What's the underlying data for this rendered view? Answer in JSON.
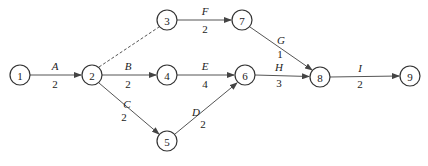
{
  "diagram": {
    "type": "activity-on-arrow network",
    "nodes": [
      {
        "id": "1",
        "label": "1",
        "x": 20,
        "y": 75
      },
      {
        "id": "2",
        "label": "2",
        "x": 92,
        "y": 75
      },
      {
        "id": "3",
        "label": "3",
        "x": 167,
        "y": 20
      },
      {
        "id": "4",
        "label": "4",
        "x": 167,
        "y": 75
      },
      {
        "id": "5",
        "label": "5",
        "x": 167,
        "y": 141
      },
      {
        "id": "6",
        "label": "6",
        "x": 245,
        "y": 75
      },
      {
        "id": "7",
        "label": "7",
        "x": 242,
        "y": 20
      },
      {
        "id": "8",
        "label": "8",
        "x": 320,
        "y": 77
      },
      {
        "id": "9",
        "label": "9",
        "x": 410,
        "y": 76
      }
    ],
    "edges": [
      {
        "from": "1",
        "to": "2",
        "activity": "A",
        "duration": "2",
        "dummy": false
      },
      {
        "from": "2",
        "to": "3",
        "activity": "",
        "duration": "",
        "dummy": true
      },
      {
        "from": "2",
        "to": "4",
        "activity": "B",
        "duration": "2",
        "dummy": false
      },
      {
        "from": "2",
        "to": "5",
        "activity": "C",
        "duration": "2",
        "dummy": false
      },
      {
        "from": "3",
        "to": "7",
        "activity": "F",
        "duration": "2",
        "dummy": false
      },
      {
        "from": "4",
        "to": "6",
        "activity": "E",
        "duration": "4",
        "dummy": false
      },
      {
        "from": "5",
        "to": "6",
        "activity": "D",
        "duration": "2",
        "dummy": false
      },
      {
        "from": "7",
        "to": "8",
        "activity": "G",
        "duration": "1",
        "dummy": false
      },
      {
        "from": "6",
        "to": "8",
        "activity": "H",
        "duration": "3",
        "dummy": false
      },
      {
        "from": "8",
        "to": "9",
        "activity": "I",
        "duration": "2",
        "dummy": false
      }
    ],
    "labels": {
      "node_1": "1",
      "node_2": "2",
      "node_3": "3",
      "node_4": "4",
      "node_5": "5",
      "node_6": "6",
      "node_7": "7",
      "node_8": "8",
      "node_9": "9",
      "A": "A",
      "A_dur": "2",
      "B": "B",
      "B_dur": "2",
      "C": "C",
      "C_dur": "2",
      "D": "D",
      "D_dur": "2",
      "E": "E",
      "E_dur": "4",
      "F": "F",
      "F_dur": "2",
      "G": "G",
      "G_dur": "1",
      "H": "H",
      "H_dur": "3",
      "I": "I",
      "I_dur": "2"
    },
    "colors": {
      "stroke": "#333333",
      "edge": "#555555",
      "text": "#222222",
      "background": "#ffffff"
    }
  }
}
